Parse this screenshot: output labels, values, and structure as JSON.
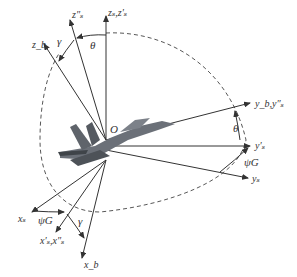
{
  "diagram": {
    "type": "coordinate-frame-rotation",
    "origin_label": "O",
    "axes": [
      {
        "id": "zs",
        "label": "z_s, z'_s",
        "display": "zₛ,z′ₛ"
      },
      {
        "id": "zs2",
        "label": "z''_s",
        "display": "z″ₛ"
      },
      {
        "id": "zb",
        "label": "z_b",
        "display": "z_b"
      },
      {
        "id": "yb",
        "label": "y_b, y''_s",
        "display": "y_b,y″ₛ"
      },
      {
        "id": "ys1",
        "label": "y'_s",
        "display": "y′ₛ"
      },
      {
        "id": "ys",
        "label": "y_s",
        "display": "yₛ"
      },
      {
        "id": "xs",
        "label": "x_s",
        "display": "xₛ"
      },
      {
        "id": "xs1",
        "label": "x'_s, x''_s",
        "display": "x′ₛ,x″ₛ"
      },
      {
        "id": "xb",
        "label": "x_b",
        "display": "x_b"
      }
    ],
    "angles": [
      {
        "id": "theta_top",
        "symbol": "θ"
      },
      {
        "id": "gamma_top",
        "symbol": "γ"
      },
      {
        "id": "theta_right",
        "symbol": "θ"
      },
      {
        "id": "psi_right",
        "symbol": "ψ_G",
        "display": "ψG"
      },
      {
        "id": "psi_bottom",
        "symbol": "ψ_G",
        "display": "ψG"
      },
      {
        "id": "gamma_bottom",
        "symbol": "γ"
      }
    ],
    "colors": {
      "line": "#333333",
      "dashed": "#444444",
      "aircraft": "#5a5f66",
      "background": "#ffffff"
    }
  }
}
